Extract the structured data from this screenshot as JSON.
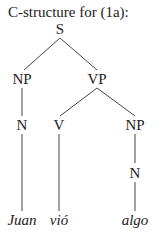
{
  "title": "C-structure for (1a):",
  "tree": {
    "nodes": [
      {
        "id": "S",
        "label": "S",
        "x": 60,
        "y": 22
      },
      {
        "id": "NP1",
        "label": "NP",
        "x": 22,
        "y": 72
      },
      {
        "id": "VP",
        "label": "VP",
        "x": 97,
        "y": 72
      },
      {
        "id": "N1",
        "label": "N",
        "x": 22,
        "y": 118
      },
      {
        "id": "V",
        "label": "V",
        "x": 59,
        "y": 118
      },
      {
        "id": "NP2",
        "label": "NP",
        "x": 135,
        "y": 118
      },
      {
        "id": "N2",
        "label": "N",
        "x": 135,
        "y": 166
      }
    ],
    "leaves": [
      {
        "id": "juan",
        "label": "Juan",
        "x": 22,
        "y": 213
      },
      {
        "id": "vio",
        "label": "vió",
        "x": 59,
        "y": 213
      },
      {
        "id": "algo",
        "label": "algo",
        "x": 135,
        "y": 213
      }
    ]
  }
}
